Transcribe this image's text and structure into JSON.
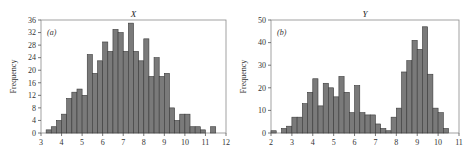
{
  "chart_data": [
    {
      "type": "bar",
      "panel_label": "(a)",
      "title": "X",
      "xlabel": "",
      "ylabel": "Frequency",
      "xlim": [
        3,
        12
      ],
      "ylim": [
        0,
        36
      ],
      "bin_width": 0.25,
      "xticks": [
        3,
        4,
        5,
        6,
        7,
        8,
        9,
        10,
        11,
        12
      ],
      "yticks": [
        0,
        4,
        8,
        12,
        16,
        20,
        24,
        28,
        32,
        36
      ],
      "bin_starts": [
        3.25,
        3.5,
        3.75,
        4.0,
        4.25,
        4.5,
        4.75,
        5.0,
        5.25,
        5.5,
        5.75,
        6.0,
        6.25,
        6.5,
        6.75,
        7.0,
        7.25,
        7.5,
        7.75,
        8.0,
        8.25,
        8.5,
        8.75,
        9.0,
        9.25,
        9.5,
        9.75,
        10.0,
        10.25,
        10.5,
        10.75,
        11.0,
        11.25
      ],
      "values": [
        1,
        2,
        4,
        6,
        11,
        13,
        14,
        12,
        25,
        19,
        23,
        29,
        26,
        33,
        32,
        26,
        35,
        26,
        23,
        30,
        18,
        24,
        18,
        19,
        8,
        4,
        6,
        6,
        2,
        2,
        1,
        0,
        2
      ],
      "grid": false
    },
    {
      "type": "bar",
      "panel_label": "(b)",
      "title": "Y",
      "xlabel": "",
      "ylabel": "Frequency",
      "xlim": [
        2,
        11
      ],
      "ylim": [
        0,
        50
      ],
      "bin_width": 0.25,
      "xticks": [
        2,
        3,
        4,
        5,
        6,
        7,
        8,
        9,
        10,
        11
      ],
      "yticks": [
        0,
        10,
        20,
        30,
        40,
        50
      ],
      "bin_starts": [
        2.0,
        2.25,
        2.5,
        2.75,
        3.0,
        3.25,
        3.5,
        3.75,
        4.0,
        4.25,
        4.5,
        4.75,
        5.0,
        5.25,
        5.5,
        5.75,
        6.0,
        6.25,
        6.5,
        6.75,
        7.0,
        7.25,
        7.5,
        7.75,
        8.0,
        8.25,
        8.5,
        8.75,
        9.0,
        9.25,
        9.5,
        9.75,
        10.0,
        10.25
      ],
      "values": [
        1,
        0,
        2,
        3,
        7,
        7,
        13,
        18,
        24,
        12,
        22,
        20,
        16,
        25,
        18,
        9,
        21,
        9,
        8,
        8,
        4,
        2,
        1,
        7,
        11,
        27,
        32,
        41,
        37,
        47,
        26,
        11,
        9,
        2
      ],
      "grid": false
    }
  ],
  "layout": {
    "panels": [
      {
        "plot_left": 41,
        "plot_right": 226,
        "plot_top": 20,
        "plot_bottom": 133
      },
      {
        "plot_left": 271,
        "plot_right": 459,
        "plot_top": 20,
        "plot_bottom": 133
      }
    ],
    "colors": {
      "bar_fill": "#7a7a7a",
      "bar_edge": "#3a3a3a",
      "frame": "#8a8a8a"
    }
  }
}
